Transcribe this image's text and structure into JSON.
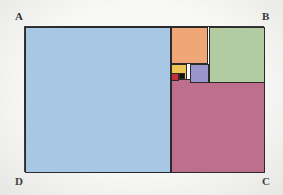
{
  "figure": {
    "background_color": "#f8f8f6",
    "stroke_color": "#2b2b2b",
    "outer_rectangle": {
      "x": 24,
      "y": 26,
      "width": 240,
      "height": 146
    },
    "corner_labels": [
      {
        "id": "A",
        "text": "A",
        "position": "top-left"
      },
      {
        "id": "B",
        "text": "B",
        "position": "top-right"
      },
      {
        "id": "C",
        "text": "C",
        "position": "bottom-right"
      },
      {
        "id": "D",
        "text": "D",
        "position": "bottom-left"
      }
    ],
    "squares": [
      {
        "id": "blue",
        "name": "largest-square",
        "color": "#a9c9e6",
        "x": 0,
        "y": 0,
        "size": 146
      },
      {
        "id": "mauve",
        "name": "second-square",
        "color": "#c0708f",
        "x": 146,
        "y": 52,
        "size": 94
      },
      {
        "id": "green",
        "name": "third-square",
        "color": "#b4cda2",
        "x": 184,
        "y": 0,
        "size": 56
      },
      {
        "id": "orange",
        "name": "fourth-square",
        "color": "#f2a878",
        "x": 146,
        "y": 0,
        "size": 37
      },
      {
        "id": "purple",
        "name": "fifth-square",
        "color": "#9e97cf",
        "x": 165,
        "y": 37,
        "size": 19
      },
      {
        "id": "yellow",
        "name": "sixth-square",
        "color": "#f0c654",
        "x": 146,
        "y": 37,
        "size": 16
      },
      {
        "id": "red",
        "name": "seventh-square",
        "color": "#c8303a",
        "x": 146,
        "y": 46,
        "size": 8
      },
      {
        "id": "black",
        "name": "eighth-square",
        "color": "#121212",
        "x": 154,
        "y": 46,
        "size": 6
      }
    ]
  },
  "chart_data": {
    "type": "diagram",
    "outer_rectangle": {
      "width": 240,
      "height": 146,
      "aspect_ratio": 1.644
    },
    "square_sizes": [
      146,
      94,
      56,
      37,
      19,
      16,
      8,
      6
    ],
    "square_colors": [
      "#a9c9e6",
      "#c0708f",
      "#b4cda2",
      "#f2a878",
      "#9e97cf",
      "#f0c654",
      "#c8303a",
      "#121212"
    ],
    "vertex_labels": [
      "A",
      "B",
      "C",
      "D"
    ],
    "grid": false,
    "legend": "none"
  }
}
